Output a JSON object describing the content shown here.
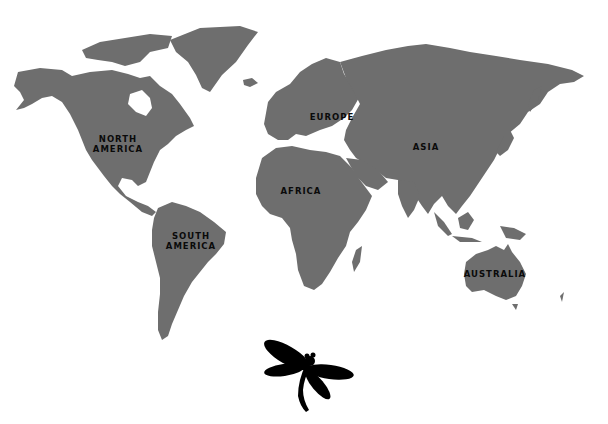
{
  "map": {
    "land_color": "#6e6e6e",
    "background_color": "#ffffff",
    "labels": {
      "north_america": [
        "NORTH",
        "AMERICA"
      ],
      "south_america": [
        "SOUTH",
        "AMERICA"
      ],
      "europe": "EUROPE",
      "africa": "AFRICA",
      "asia": "ASIA",
      "australia": "AUSTRALIA"
    }
  },
  "decoration": {
    "icon": "dragonfly-icon",
    "color": "#000000"
  }
}
